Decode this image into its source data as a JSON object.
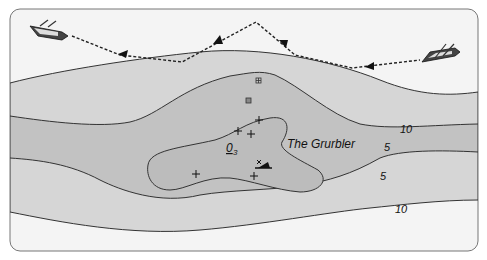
{
  "map": {
    "title_label": "The Grurbler",
    "obstruction_label": "0",
    "obstruction_subscript": "3",
    "depth_contours": [
      {
        "value": "10",
        "label": "10"
      },
      {
        "value": "5",
        "label": "5"
      },
      {
        "value": "5",
        "label": "5"
      },
      {
        "value": "10",
        "label": "10"
      }
    ],
    "colors": {
      "background": "#ffffff",
      "shallow_band": "#d9d9d9",
      "mid_band": "#c4c4c4",
      "deep_band": "#b3b3b3",
      "outer_white": "#f2f2f2",
      "contour_line": "#333333",
      "route_line": "#222222"
    },
    "features": {
      "boats": [
        "boat-left",
        "boat-right"
      ],
      "route": "dashed-course-with-arrows",
      "hazards": [
        "rock-marker-1",
        "rock-marker-2",
        "crosses",
        "wreck-symbol"
      ]
    }
  }
}
